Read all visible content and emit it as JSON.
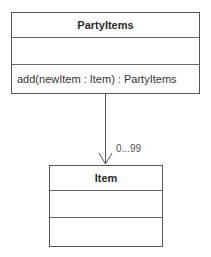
{
  "diagram": {
    "type": "uml-class-diagram",
    "classes": [
      {
        "name": "PartyItems",
        "attributes": [],
        "operations": [
          "add(newItem : Item) : PartyItems"
        ]
      },
      {
        "name": "Item",
        "attributes": [],
        "operations": []
      }
    ],
    "association": {
      "from": "PartyItems",
      "to": "Item",
      "navigability": "directed",
      "target_multiplicity": "0...99"
    },
    "colors": {
      "line": "#555555",
      "text": "#2a2a2a",
      "background": "#ffffff"
    }
  }
}
